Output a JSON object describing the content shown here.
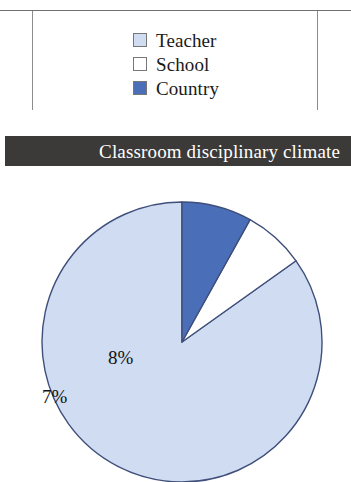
{
  "figure": {
    "title": "Classroom disciplinary climate"
  },
  "legend": {
    "items": [
      {
        "label": "Teacher",
        "color": "#cfdcf2",
        "swatch_icon": "square-swatch-icon"
      },
      {
        "label": "School",
        "color": "#ffffff",
        "swatch_icon": "square-swatch-icon"
      },
      {
        "label": "Country",
        "color": "#4a6fb8",
        "swatch_icon": "square-swatch-icon"
      }
    ]
  },
  "chart_data": {
    "type": "pie",
    "title": "Classroom disciplinary climate",
    "categories": [
      "Teacher",
      "School",
      "Country"
    ],
    "values": [
      84,
      7,
      8
    ],
    "value_labels": [
      "84%",
      "7%",
      "8%"
    ],
    "colors": [
      "#cfdcf2",
      "#ffffff",
      "#4a6fb8"
    ],
    "units": "percent",
    "start_angle_deg": 0,
    "direction": "counterclockwise",
    "legend_position": "top",
    "grid": false,
    "xlabel": "",
    "ylabel": ""
  },
  "style": {
    "title_bar_color": "#3b3a38",
    "title_text_color": "#ffffff",
    "pie_outline_color": "#3f4f7a",
    "rule_color": "#6f6f6f"
  }
}
